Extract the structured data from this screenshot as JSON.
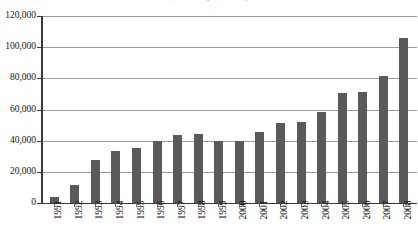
{
  "chart_data": {
    "type": "bar",
    "title": "(number of accounts)",
    "subtitle": "",
    "xlabel": "",
    "ylabel": "",
    "categories": [
      "1991",
      "1992",
      "1993",
      "1994",
      "1995",
      "1996",
      "1997",
      "1998",
      "1999",
      "2000",
      "2001",
      "2002",
      "2003",
      "2004",
      "2005",
      "2006",
      "2007",
      "2008"
    ],
    "values": [
      4000,
      11500,
      27500,
      33500,
      35500,
      39500,
      43500,
      44500,
      39500,
      40000,
      45500,
      51500,
      52000,
      58500,
      70500,
      71000,
      81500,
      106000
    ],
    "ylim": [
      0,
      120000
    ],
    "ytick_values": [
      0,
      20000,
      40000,
      60000,
      80000,
      100000,
      120000
    ],
    "ytick_labels": [
      "0",
      "20,000",
      "40,000",
      "60,000",
      "80,000",
      "100,000",
      "120,000"
    ],
    "grid": true,
    "grid_axis": "y",
    "legend": false,
    "legend_position": "none",
    "bar_color": "#5a5a5a",
    "gridline_color": "#9a9a9a",
    "axis_color": "#3a3a3a",
    "background_color": "#ffffff"
  }
}
